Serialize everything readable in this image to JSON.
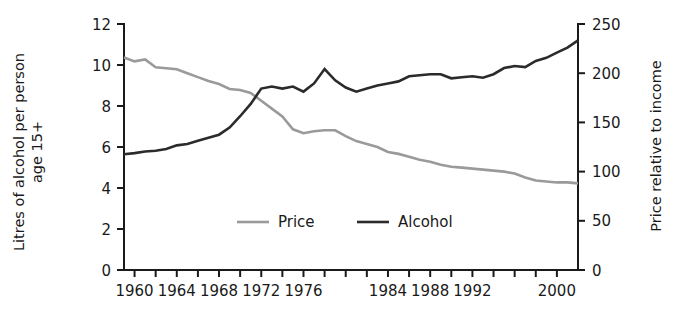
{
  "chart_data": {
    "type": "line",
    "title": "",
    "subtitle": "",
    "xlabel": "",
    "ylabel": "Litres of alcohol per person age 15+",
    "ylabel_line1": "Litres of alcohol per person",
    "ylabel_line2": "age 15+",
    "y2label": "Price relative to income",
    "grid": false,
    "legend_position": "inside-bottom-center",
    "xlim": [
      1959,
      2002
    ],
    "ylim": [
      0,
      12
    ],
    "y2lim": [
      0,
      250
    ],
    "y_ticks": [
      0,
      2,
      4,
      6,
      8,
      10,
      12
    ],
    "y_tick_labels": [
      "0",
      "2",
      "4",
      "6",
      "8",
      "10",
      "12"
    ],
    "y2_ticks": [
      0,
      50,
      100,
      150,
      200,
      250
    ],
    "y2_tick_labels": [
      "0",
      "50",
      "100",
      "150",
      "200",
      "250"
    ],
    "x_minor_ticks": [
      1960,
      1962,
      1964,
      1966,
      1968,
      1970,
      1972,
      1974,
      1976,
      1978,
      1980,
      1982,
      1984,
      1986,
      1988,
      1990,
      1992,
      1994,
      1996,
      1998,
      2000
    ],
    "x_tick_labels": [
      {
        "value": 1960,
        "label": "1960"
      },
      {
        "value": 1964,
        "label": "1964"
      },
      {
        "value": 1968,
        "label": "1968"
      },
      {
        "value": 1972,
        "label": "1972"
      },
      {
        "value": 1976,
        "label": "1976"
      },
      {
        "value": 1984,
        "label": "1984"
      },
      {
        "value": 1988,
        "label": "1988"
      },
      {
        "value": 1992,
        "label": "1992"
      },
      {
        "value": 2000,
        "label": "2000"
      }
    ],
    "x": [
      1959,
      1960,
      1961,
      1962,
      1963,
      1964,
      1965,
      1966,
      1967,
      1968,
      1969,
      1970,
      1971,
      1972,
      1973,
      1974,
      1975,
      1976,
      1977,
      1978,
      1979,
      1980,
      1981,
      1982,
      1983,
      1984,
      1985,
      1986,
      1987,
      1988,
      1989,
      1990,
      1991,
      1992,
      1993,
      1994,
      1995,
      1996,
      1997,
      1998,
      1999,
      2000,
      2001,
      2002
    ],
    "series": [
      {
        "name": "Price",
        "axis": "right",
        "color": "#9a9a9a",
        "values": [
          216,
          212,
          214,
          206,
          205,
          204,
          200,
          196,
          192,
          189,
          184,
          183,
          180,
          172,
          164,
          156,
          143,
          139,
          141,
          142,
          142,
          136,
          131,
          128,
          125,
          120,
          118,
          115,
          112,
          110,
          107,
          105,
          104,
          103,
          102,
          101,
          100,
          98,
          94,
          91,
          90,
          89,
          89,
          88
        ]
      },
      {
        "name": "Alcohol",
        "axis": "left",
        "color": "#2b2b2b",
        "values": [
          5.65,
          5.7,
          5.78,
          5.82,
          5.9,
          6.08,
          6.15,
          6.3,
          6.45,
          6.6,
          6.95,
          7.5,
          8.1,
          8.85,
          8.95,
          8.85,
          8.95,
          8.7,
          9.1,
          9.8,
          9.25,
          8.9,
          8.7,
          8.85,
          9.0,
          9.1,
          9.2,
          9.45,
          9.5,
          9.55,
          9.55,
          9.35,
          9.4,
          9.45,
          9.38,
          9.55,
          9.85,
          9.95,
          9.9,
          10.2,
          10.35,
          10.6,
          10.85,
          11.2
        ]
      }
    ],
    "legend": [
      {
        "label": "Price",
        "color": "#9a9a9a"
      },
      {
        "label": "Alcohol",
        "color": "#2b2b2b"
      }
    ]
  }
}
